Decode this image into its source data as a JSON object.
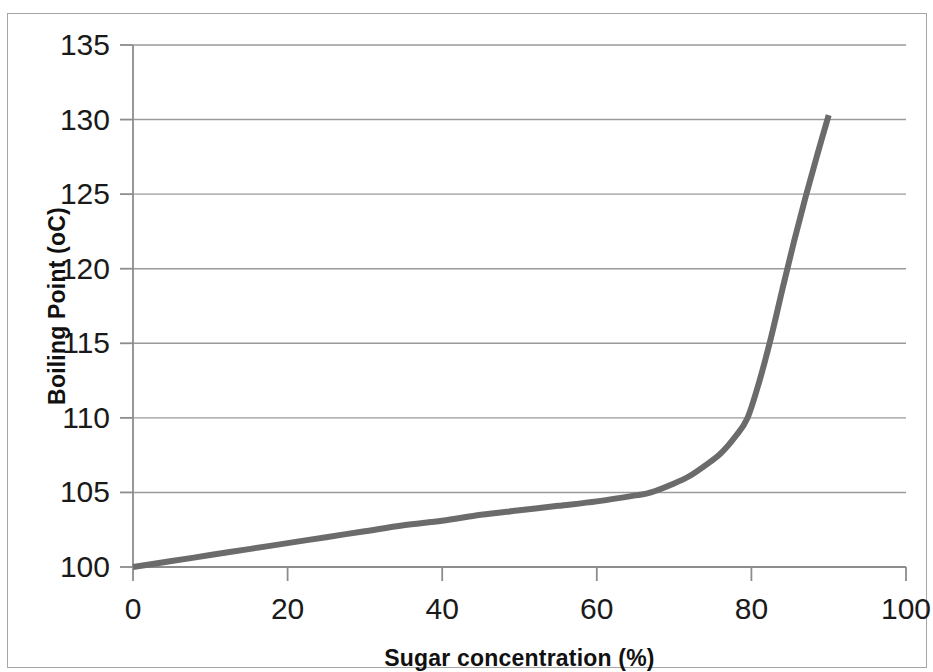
{
  "chart_data": {
    "type": "line",
    "title": "",
    "subtitle": "",
    "xlabel": "Sugar concentration (%)",
    "ylabel": "Boiling Point (oC)",
    "xlim": [
      0,
      100
    ],
    "ylim": [
      100,
      135
    ],
    "x_ticks": [
      0,
      20,
      40,
      60,
      80,
      100
    ],
    "y_ticks": [
      100,
      105,
      110,
      115,
      120,
      125,
      130,
      135
    ],
    "x_tick_labels": [
      "0",
      "20",
      "40",
      "60",
      "80",
      "100"
    ],
    "y_tick_labels": [
      "100",
      "105",
      "110",
      "115",
      "120",
      "125",
      "130",
      "135"
    ],
    "grid": "horizontal",
    "legend": "none",
    "series": [
      {
        "name": "Boiling point of sugar solution",
        "color": "#6b6b6b",
        "line_width": 6,
        "x": [
          0,
          5,
          10,
          15,
          20,
          25,
          30,
          35,
          40,
          45,
          50,
          55,
          60,
          65,
          67,
          70,
          72,
          74,
          76,
          78,
          79.5,
          81,
          82.5,
          84,
          85.5,
          87,
          88.5,
          90
        ],
        "y": [
          100.0,
          100.4,
          100.8,
          101.2,
          101.6,
          102.0,
          102.4,
          102.8,
          103.1,
          103.5,
          103.8,
          104.1,
          104.4,
          104.8,
          105.0,
          105.6,
          106.1,
          106.8,
          107.6,
          108.8,
          110.0,
          112.4,
          115.3,
          118.6,
          121.8,
          124.8,
          127.6,
          130.3
        ]
      }
    ],
    "annotations": [],
    "colors": {
      "line": "#6b6b6b",
      "gridline": "#9a9a9a",
      "axis": "#8c8c8c",
      "text": "#1a1a1a",
      "frame": "#a6a6a6",
      "background": "#ffffff"
    }
  },
  "geometry": {
    "plot_left_px": 133,
    "plot_right_px": 906,
    "plot_top_px": 45,
    "plot_bottom_px": 567
  }
}
